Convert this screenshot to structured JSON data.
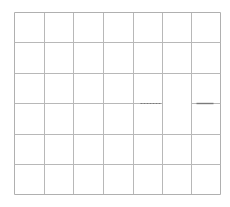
{
  "chart_data": {
    "type": "line",
    "title": "",
    "xlabel": "",
    "ylabel": "",
    "grid": true,
    "grid_columns": 7,
    "grid_rows": 6,
    "x_grid_px": [
      14,
      44,
      73,
      103,
      133,
      162,
      191,
      220
    ],
    "y_grid_px": [
      12,
      42,
      73,
      103,
      134,
      164,
      194
    ],
    "series": [],
    "annotations": [
      {
        "kind": "dashed-segment",
        "y_px": 103,
        "x_from_px": 140,
        "x_to_px": 160
      },
      {
        "kind": "solid-segment",
        "y_px": 103,
        "x_from_px": 196,
        "x_to_px": 213
      }
    ],
    "gap_in_gridline": {
      "y_px": 103,
      "x_from_px": 162,
      "x_to_px": 191
    }
  },
  "colors": {
    "background": "#ffffff",
    "grid": "#b8b8b8",
    "frame": "#b0b0b0",
    "segment": "#7a7a7a"
  }
}
